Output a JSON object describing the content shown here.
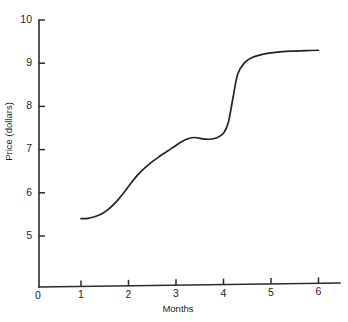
{
  "chart_data": {
    "type": "line",
    "title": "",
    "xlabel": "Months",
    "ylabel": "Price (dollars)",
    "xlim": [
      0,
      6.6
    ],
    "ylim": [
      4.5,
      10.2
    ],
    "grid": false,
    "legend": null,
    "x_ticks": [
      "1",
      "2",
      "3",
      "4",
      "5",
      "6"
    ],
    "x_tick_values": [
      1,
      2,
      3,
      4,
      5,
      6
    ],
    "y_ticks": [
      "5",
      "6",
      "7",
      "8",
      "9",
      "10"
    ],
    "y_tick_values": [
      5,
      6,
      7,
      8,
      9,
      10
    ],
    "origin_label": "0",
    "series": [
      {
        "name": "Price",
        "color": "#232323",
        "x": [
          1.0,
          1.15,
          1.3,
          1.45,
          1.6,
          1.75,
          1.9,
          2.05,
          2.2,
          2.35,
          2.5,
          2.65,
          2.8,
          2.95,
          3.1,
          3.25,
          3.4,
          3.55,
          3.7,
          3.85,
          4.0,
          4.1,
          4.2,
          4.3,
          4.45,
          4.6,
          4.8,
          5.0,
          5.25,
          5.5,
          5.75,
          6.0
        ],
        "y": [
          5.4,
          5.41,
          5.45,
          5.52,
          5.64,
          5.8,
          6.0,
          6.22,
          6.42,
          6.58,
          6.72,
          6.84,
          6.95,
          7.06,
          7.17,
          7.25,
          7.28,
          7.25,
          7.24,
          7.27,
          7.38,
          7.62,
          8.2,
          8.75,
          9.02,
          9.13,
          9.2,
          9.24,
          9.27,
          9.28,
          9.29,
          9.3
        ]
      }
    ]
  },
  "axes": {
    "y_axis_name": "price-axis",
    "x_axis_name": "months-axis"
  }
}
